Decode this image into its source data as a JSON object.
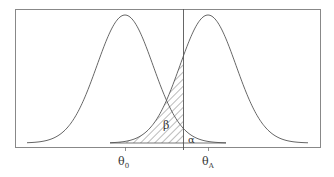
{
  "chart_data": {
    "type": "line",
    "title": "",
    "xlabel": "",
    "ylabel": "",
    "grid": false,
    "legend": null,
    "series": [
      {
        "name": "H0 distribution",
        "center_label": "θ0",
        "mean_px": 125,
        "sigma_px": 28
      },
      {
        "name": "HA distribution",
        "center_label": "θA",
        "mean_px": 208,
        "sigma_px": 28
      }
    ],
    "critical_value_px": 183,
    "x_ticks": [
      {
        "label": "θ",
        "sub": "0",
        "x": 125
      },
      {
        "label": "θ",
        "sub": "A",
        "x": 208
      }
    ],
    "annotations": [
      {
        "text": "β",
        "meaning": "Type II error region (hatched, under HA left of critical line)"
      },
      {
        "text": "α",
        "meaning": "Type I error region (under H0 right of critical line)"
      }
    ]
  },
  "colors": {
    "curve": "#555555",
    "frame": "#888888",
    "hatch": "#555555"
  }
}
